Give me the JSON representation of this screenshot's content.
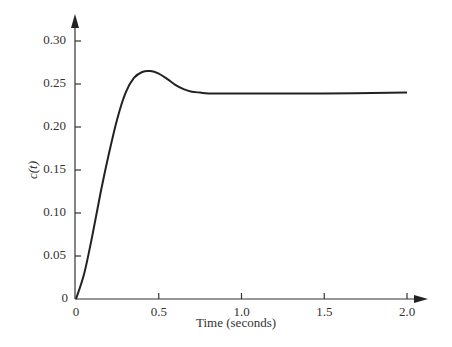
{
  "chart_data": {
    "type": "line",
    "title": "",
    "xlabel": "Time (seconds)",
    "ylabel": "c(t)",
    "xlim": [
      0,
      2.1
    ],
    "ylim": [
      0,
      0.31
    ],
    "grid": false,
    "x_ticks": [
      "0",
      "0.5",
      "1.0",
      "1.5",
      "2.0"
    ],
    "y_ticks": [
      "0",
      "0.05",
      "0.10",
      "0.15",
      "0.20",
      "0.25",
      "0.30"
    ],
    "series": [
      {
        "name": "c(t)",
        "x": [
          0,
          0.05,
          0.1,
          0.15,
          0.2,
          0.25,
          0.3,
          0.35,
          0.4,
          0.45,
          0.5,
          0.55,
          0.6,
          0.65,
          0.7,
          0.75,
          0.8,
          0.9,
          1.0,
          1.5,
          2.0
        ],
        "values": [
          0,
          0.03,
          0.075,
          0.125,
          0.17,
          0.21,
          0.24,
          0.257,
          0.264,
          0.265,
          0.262,
          0.256,
          0.249,
          0.244,
          0.241,
          0.24,
          0.239,
          0.239,
          0.239,
          0.239,
          0.24
        ]
      }
    ]
  }
}
